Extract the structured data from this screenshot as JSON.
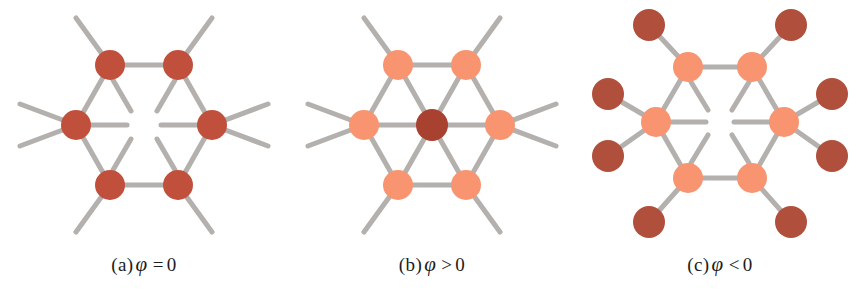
{
  "figure": {
    "background_color": "#ffffff",
    "bond_color": "#b3b0ad",
    "bond_width": 5,
    "dark_atom_color": "#c0503c",
    "light_atom_color": "#f89470",
    "atom_radius": 15,
    "outer_atom_radius": 16
  },
  "panels": [
    {
      "id": "panel-a",
      "caption": {
        "label": "(a)",
        "symbol": "φ",
        "relation": "=",
        "value": "0",
        "full": "(a) φ = 0"
      },
      "description": "hexagonal ring of six dark atoms with outward bonds and inward stubs",
      "center": {
        "x": 144,
        "y": 125
      },
      "hex_radius": 62,
      "ring_atom_count": 6,
      "ring_atom_color": "#c0503c",
      "center_atom": null,
      "has_inward_stubs": true,
      "outer_atoms_per_vertex": 0,
      "ring_atoms": [
        {
          "name": "atom-top-left",
          "x": 110,
          "y": 65,
          "color": "#c0503c"
        },
        {
          "name": "atom-top-right",
          "x": 178,
          "y": 65,
          "color": "#c0503c"
        },
        {
          "name": "atom-right",
          "x": 212,
          "y": 125,
          "color": "#c0503c"
        },
        {
          "name": "atom-bottom-right",
          "x": 178,
          "y": 185,
          "color": "#c0503c"
        },
        {
          "name": "atom-bottom-left",
          "x": 110,
          "y": 185,
          "color": "#c0503c"
        },
        {
          "name": "atom-left",
          "x": 76,
          "y": 125,
          "color": "#c0503c"
        }
      ]
    },
    {
      "id": "panel-b",
      "caption": {
        "label": "(b)",
        "symbol": "φ",
        "relation": ">",
        "value": "0",
        "full": "(b) φ > 0"
      },
      "description": "hexagonal ring of six light atoms bonded to a central dark atom",
      "center": {
        "x": 144,
        "y": 125
      },
      "hex_radius": 62,
      "ring_atom_count": 6,
      "ring_atom_color": "#f89470",
      "center_atom": {
        "name": "atom-center",
        "x": 144,
        "y": 125,
        "color": "#a8412f"
      },
      "has_inward_stubs": false,
      "outer_atoms_per_vertex": 0,
      "ring_atoms": [
        {
          "name": "atom-top-left",
          "x": 110,
          "y": 65,
          "color": "#f89470"
        },
        {
          "name": "atom-top-right",
          "x": 178,
          "y": 65,
          "color": "#f89470"
        },
        {
          "name": "atom-right",
          "x": 212,
          "y": 125,
          "color": "#f89470"
        },
        {
          "name": "atom-bottom-right",
          "x": 178,
          "y": 185,
          "color": "#f89470"
        },
        {
          "name": "atom-bottom-left",
          "x": 110,
          "y": 185,
          "color": "#f89470"
        },
        {
          "name": "atom-left",
          "x": 76,
          "y": 125,
          "color": "#f89470"
        }
      ]
    },
    {
      "id": "panel-c",
      "caption": {
        "label": "(c)",
        "symbol": "φ",
        "relation": "<",
        "value": "0",
        "full": "(c) φ < 0"
      },
      "description": "hexagonal ring of six light atoms each bonded to two outer dark atoms, with inward stubs",
      "center": {
        "x": 144,
        "y": 122
      },
      "hex_radius": 60,
      "ring_atom_count": 6,
      "ring_atom_color": "#f89470",
      "center_atom": null,
      "has_inward_stubs": true,
      "outer_atoms_per_vertex": 2,
      "outer_atom_color": "#b0503c",
      "outer_bond_length": 46,
      "ring_atoms": [
        {
          "name": "atom-top-left",
          "x": 112,
          "y": 67,
          "color": "#f89470"
        },
        {
          "name": "atom-top-right",
          "x": 176,
          "y": 67,
          "color": "#f89470"
        },
        {
          "name": "atom-right",
          "x": 208,
          "y": 122,
          "color": "#f89470"
        },
        {
          "name": "atom-bottom-right",
          "x": 176,
          "y": 178,
          "color": "#f89470"
        },
        {
          "name": "atom-bottom-left",
          "x": 112,
          "y": 178,
          "color": "#f89470"
        },
        {
          "name": "atom-left",
          "x": 80,
          "y": 122,
          "color": "#f89470"
        }
      ],
      "outer_atoms": [
        {
          "name": "outer-atom-1",
          "x": 73,
          "y": 25,
          "color": "#b0503c"
        },
        {
          "name": "outer-atom-2",
          "x": 215,
          "y": 25,
          "color": "#b0503c"
        },
        {
          "name": "outer-atom-3",
          "x": 32,
          "y": 94,
          "color": "#b0503c"
        },
        {
          "name": "outer-atom-4",
          "x": 256,
          "y": 94,
          "color": "#b0503c"
        },
        {
          "name": "outer-atom-5",
          "x": 32,
          "y": 156,
          "color": "#b0503c"
        },
        {
          "name": "outer-atom-6",
          "x": 256,
          "y": 156,
          "color": "#b0503c"
        },
        {
          "name": "outer-atom-7",
          "x": 73,
          "y": 222,
          "color": "#b0503c"
        },
        {
          "name": "outer-atom-8",
          "x": 215,
          "y": 222,
          "color": "#b0503c"
        }
      ]
    }
  ]
}
